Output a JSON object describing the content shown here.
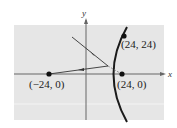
{
  "diagram": {
    "axes": {
      "x_label": "x",
      "y_label": "y"
    },
    "points": [
      {
        "label": "(24, 24)",
        "x": 24,
        "y": 24
      },
      {
        "label": "(−24, 0)",
        "x": -24,
        "y": 0
      },
      {
        "label": "(24, 0)",
        "x": 24,
        "y": 0
      }
    ],
    "curve": "hyperbola branch (right)",
    "rays": [
      "incoming ray toward focus (24,0) reflecting off hyperbola",
      "reflected ray toward (-24,0)"
    ],
    "colors": {
      "panel": "#e6e6e6",
      "curve": "#1a1a1a",
      "axis": "#555555"
    }
  }
}
